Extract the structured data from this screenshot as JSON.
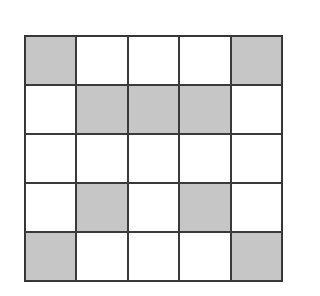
{
  "grid": {
    "rows": 5,
    "cols": 5,
    "shaded_color": "#c6c6c6",
    "pattern": [
      [
        1,
        0,
        0,
        0,
        1
      ],
      [
        0,
        1,
        1,
        1,
        0
      ],
      [
        0,
        0,
        0,
        0,
        0
      ],
      [
        0,
        1,
        0,
        1,
        0
      ],
      [
        1,
        0,
        0,
        0,
        1
      ]
    ]
  }
}
